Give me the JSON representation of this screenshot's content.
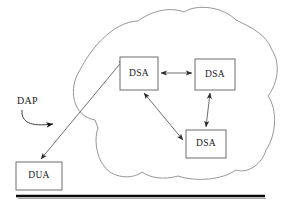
{
  "diagram": {
    "colors": {
      "box_stroke": "#6e6e6e",
      "cloud_stroke": "#8a8a8a",
      "arrow_stroke": "#4a4a4a",
      "text": "#1a1a1a",
      "rule": "#0a0a0a",
      "background": "#ffffff"
    },
    "nodes": [
      {
        "id": "dsa-1",
        "label": "DSA",
        "x": 120,
        "y": 57,
        "w": 38,
        "h": 33,
        "cx": 139,
        "cy": 73.5
      },
      {
        "id": "dsa-2",
        "label": "DSA",
        "x": 195,
        "y": 59,
        "w": 40,
        "h": 31,
        "cx": 215,
        "cy": 74.5
      },
      {
        "id": "dsa-3",
        "label": "DSA",
        "x": 186,
        "y": 130,
        "w": 40,
        "h": 28,
        "cx": 206,
        "cy": 144
      },
      {
        "id": "dua-1",
        "label": "DUA",
        "x": 16,
        "y": 162,
        "w": 46,
        "h": 28,
        "cx": 39,
        "cy": 176
      }
    ],
    "annotations": [
      {
        "id": "dap-label",
        "label": "DAP",
        "x": 17,
        "y": 102
      }
    ],
    "links": [
      {
        "id": "dsa1-dsa2",
        "from": "dsa-1",
        "to": "dsa-2",
        "arrows": "both"
      },
      {
        "id": "dsa2-dsa3",
        "from": "dsa-2",
        "to": "dsa-3",
        "arrows": "both"
      },
      {
        "id": "dsa1-dsa3",
        "from": "dsa-1",
        "to": "dsa-3",
        "arrows": "both"
      },
      {
        "id": "dua-dsa1",
        "from": "dua-1",
        "to": "dsa-1",
        "arrows": "both"
      }
    ],
    "cloud": {
      "id": "directory-cloud",
      "description": "cloud enclosing the three DSA nodes"
    },
    "rule": {
      "id": "bottom-rule",
      "x1": 16,
      "x2": 265,
      "y": 196
    }
  }
}
